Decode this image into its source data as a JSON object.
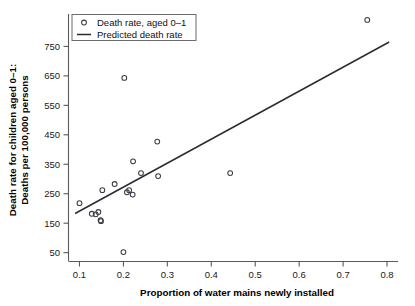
{
  "chart_data": {
    "type": "scatter",
    "title": "",
    "xlabel": "Proportion of water mains newly installed",
    "ylabel_line1": "Death rate for children aged 0–1:",
    "ylabel_line2": "Deaths per 100,000 persons",
    "xlim": [
      0.075,
      0.825
    ],
    "ylim": [
      20,
      860
    ],
    "xticks": [
      0.1,
      0.2,
      0.3,
      0.4,
      0.5,
      0.6,
      0.7,
      0.8
    ],
    "xticklabels": [
      "0.1",
      "0.2",
      "0.3",
      "0.4",
      "0.5",
      "0.6",
      "0.7",
      "0.8"
    ],
    "yticks": [
      50,
      150,
      250,
      350,
      450,
      550,
      650,
      750
    ],
    "yticklabels": [
      "50",
      "150",
      "250",
      "350",
      "450",
      "550",
      "650",
      "750"
    ],
    "grid": false,
    "legend_position": "upper-left",
    "series": [
      {
        "name": "Death rate, aged 0–1",
        "type": "scatter",
        "marker": "open-circle",
        "color": "#3c3c46",
        "points": [
          {
            "x": 0.1,
            "y": 218
          },
          {
            "x": 0.128,
            "y": 182
          },
          {
            "x": 0.137,
            "y": 180
          },
          {
            "x": 0.143,
            "y": 188
          },
          {
            "x": 0.148,
            "y": 160
          },
          {
            "x": 0.149,
            "y": 157
          },
          {
            "x": 0.152,
            "y": 262
          },
          {
            "x": 0.18,
            "y": 283
          },
          {
            "x": 0.2,
            "y": 52
          },
          {
            "x": 0.202,
            "y": 643
          },
          {
            "x": 0.208,
            "y": 255
          },
          {
            "x": 0.213,
            "y": 262
          },
          {
            "x": 0.221,
            "y": 247
          },
          {
            "x": 0.222,
            "y": 360
          },
          {
            "x": 0.24,
            "y": 320
          },
          {
            "x": 0.277,
            "y": 427
          },
          {
            "x": 0.279,
            "y": 310
          },
          {
            "x": 0.443,
            "y": 320
          },
          {
            "x": 0.755,
            "y": 840
          }
        ]
      },
      {
        "name": "Predicted death rate",
        "type": "line",
        "color": "#2b2b33",
        "endpoints": [
          {
            "x": 0.09,
            "y": 183
          },
          {
            "x": 0.805,
            "y": 765
          }
        ]
      }
    ],
    "legend_entries": [
      {
        "label": "Death rate, aged 0–1",
        "marker": "open-circle"
      },
      {
        "label": "Predicted death rate",
        "marker": "line"
      }
    ]
  }
}
